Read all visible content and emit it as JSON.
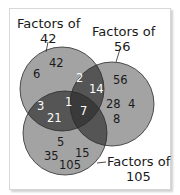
{
  "diagram": {
    "type": "venn-3",
    "sets": [
      {
        "id": "A",
        "label_line1": "Factors of",
        "label_line2": "42"
      },
      {
        "id": "B",
        "label_line1": "Factors of",
        "label_line2": "56"
      },
      {
        "id": "C",
        "label_line1": "Factors of",
        "label_line2": "105"
      }
    ],
    "regions": {
      "A_only": [
        "42",
        "6"
      ],
      "B_only": [
        "56",
        "28",
        "4",
        "8"
      ],
      "C_only": [
        "5",
        "35",
        "15",
        "105"
      ],
      "A_and_B_only": [
        "2",
        "14"
      ],
      "A_and_C_only": [
        "3",
        "21"
      ],
      "A_B_C": [
        "1",
        "7"
      ],
      "B_and_C_only": []
    },
    "colors": {
      "single": "#a3a3a3",
      "double": "#5a5a5a",
      "triple": "#3d3d3d",
      "outline": "#2a2a2a",
      "background": "#ffffff"
    }
  }
}
